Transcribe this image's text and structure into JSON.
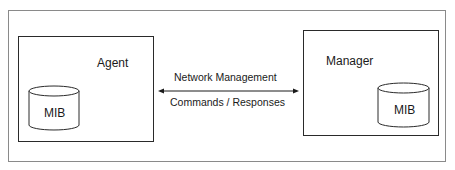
{
  "diagram": {
    "agent": {
      "label": "Agent",
      "database": {
        "label": "MIB",
        "shape": "cylinder"
      }
    },
    "manager": {
      "label": "Manager",
      "database": {
        "label": "MIB",
        "shape": "cylinder"
      }
    },
    "link": {
      "type": "bidirectional-arrow",
      "top_label": "Network Management",
      "bottom_label": "Commands / Responses"
    },
    "colors": {
      "background": "#ffffff",
      "stroke": "#2a2a2a",
      "frame": "#8a8a8a",
      "text": "#1a1a1a"
    }
  }
}
